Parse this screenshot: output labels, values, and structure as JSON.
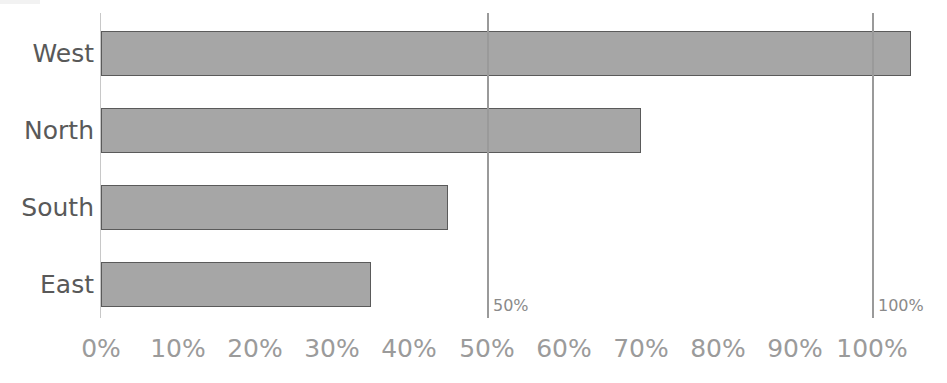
{
  "chart_data": {
    "type": "bar",
    "orientation": "horizontal",
    "title": "",
    "xlabel": "",
    "ylabel": "",
    "categories": [
      "West",
      "North",
      "South",
      "East"
    ],
    "values": [
      105,
      70,
      45,
      35
    ],
    "value_suffix": "%",
    "xlim": [
      0,
      110
    ],
    "xticks": [
      0,
      10,
      20,
      30,
      40,
      50,
      60,
      70,
      80,
      90,
      100
    ],
    "xtick_labels": [
      "0%",
      "10%",
      "20%",
      "30%",
      "40%",
      "50%",
      "60%",
      "70%",
      "80%",
      "90%",
      "100%"
    ],
    "grid": false,
    "legend": "none",
    "series": [
      {
        "name": "",
        "values": [
          105,
          70,
          45,
          35
        ]
      }
    ],
    "reference_lines": [
      {
        "value": 50,
        "label": "50%"
      },
      {
        "value": 100,
        "label": "100%"
      }
    ],
    "colors": {
      "bar_fill": "#a6a6a6",
      "bar_border": "#5a5a5a",
      "axis": "#c8c8c8",
      "reference_line": "#9a9a9a",
      "tick_text": "#9b9b9b",
      "category_text": "#595959",
      "reference_label_text": "#8a8a8a",
      "background": "#ffffff"
    }
  }
}
